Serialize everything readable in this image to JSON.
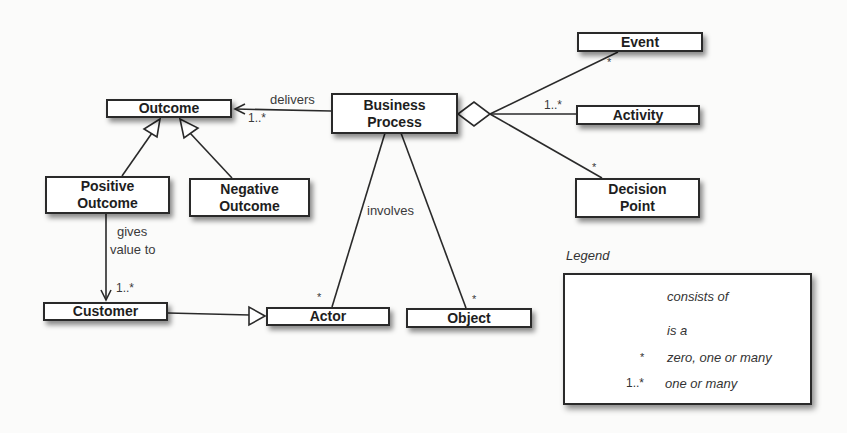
{
  "diagram": {
    "type": "UML class diagram",
    "classes": {
      "outcome": "Outcome",
      "business_process": "Business\nProcess",
      "event": "Event",
      "activity": "Activity",
      "decision_point": "Decision\nPoint",
      "positive_outcome": "Positive\nOutcome",
      "negative_outcome": "Negative\nOutcome",
      "customer": "Customer",
      "actor": "Actor",
      "object": "Object"
    },
    "associations": {
      "delivers": {
        "label": "delivers",
        "multiplicity": "1..*",
        "from": "Business Process",
        "to": "Outcome"
      },
      "gives_value_to": {
        "label_line1": "gives",
        "label_line2": "value to",
        "multiplicity": "1..*",
        "from": "Positive Outcome",
        "to": "Customer"
      },
      "involves": {
        "label": "involves",
        "actor_multiplicity": "*",
        "object_multiplicity": "*"
      },
      "event_multiplicity": "*",
      "activity_multiplicity": "1..*",
      "decision_point_multiplicity": "*"
    },
    "generalizations": [
      {
        "child": "Positive Outcome",
        "parent": "Outcome"
      },
      {
        "child": "Negative Outcome",
        "parent": "Outcome"
      },
      {
        "child": "Customer",
        "parent": "Actor"
      }
    ],
    "aggregations": [
      {
        "whole": "Business Process",
        "parts": [
          "Event",
          "Activity",
          "Decision Point"
        ]
      }
    ]
  },
  "legend": {
    "title": "Legend",
    "items": [
      {
        "symbol": "diamond-line",
        "text": "consists of"
      },
      {
        "symbol": "triangle-line",
        "text": "is a"
      },
      {
        "symbol": "*",
        "text": "zero, one or many"
      },
      {
        "symbol": "1..*",
        "text": "one or many"
      }
    ]
  },
  "colors": {
    "line": "#2a2a2a",
    "box_fill": "#ffffff",
    "background": "#fbfbfa"
  }
}
